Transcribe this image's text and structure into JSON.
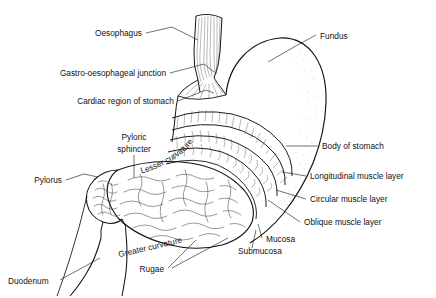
{
  "figure": {
    "background": "#ffffff",
    "ink": "#111111",
    "width": 436,
    "height": 298
  },
  "labels": {
    "oesophagus": "Oesophagus",
    "gastro_oesophageal_junction": "Gastro-oesophageal junction",
    "cardiac_region": "Cardiac region of stomach",
    "pyloric_line1": "Pyloric",
    "pyloric_line2": "sphincter",
    "pylorus": "Pylorus",
    "duodenum": "Duodenum",
    "rugae": "Rugae",
    "lesser_curvature": "Lesser curvature",
    "greater_curvature": "Greater curvature",
    "fundus": "Fundus",
    "body_of_stomach": "Body of stomach",
    "longitudinal_muscle": "Longitudinal muscle layer",
    "circular_muscle": "Circular muscle layer",
    "oblique_muscle": "Oblique muscle layer",
    "mucosa": "Mucosa",
    "submucosa": "Submucosa"
  }
}
